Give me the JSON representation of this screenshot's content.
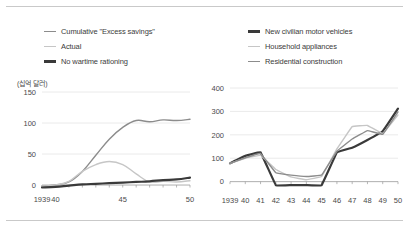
{
  "figure": {
    "background": "#ffffff",
    "rule_color": "#c9c9c9",
    "text_color": "#3b3b3b",
    "grid_color": "#e4e4e4",
    "axis_color": "#9a9a9a"
  },
  "colors": {
    "dark": "#3a3a3a",
    "medium": "#8c8c8c",
    "light": "#c6c6c6"
  },
  "left_panel": {
    "legend": [
      {
        "label": "Cumulative \"Excess savings\"",
        "color": "#8c8c8c",
        "width": 1.4,
        "name": "legend-cumulative-excess-savings"
      },
      {
        "label": "Actual",
        "color": "#c6c6c6",
        "width": 1.4,
        "name": "legend-actual"
      },
      {
        "label": "No wartime rationing",
        "color": "#3a3a3a",
        "width": 2.2,
        "name": "legend-no-wartime-rationing"
      }
    ],
    "unit_label": "(십억 달러)"
  },
  "right_panel": {
    "legend": [
      {
        "label": "New civilian motor vehicles",
        "color": "#3a3a3a",
        "width": 2.2,
        "name": "legend-new-civilian-motor-vehicles"
      },
      {
        "label": "Household appliances",
        "color": "#c6c6c6",
        "width": 1.4,
        "name": "legend-household-appliances"
      },
      {
        "label": "Residential construction",
        "color": "#8c8c8c",
        "width": 1.4,
        "name": "legend-residential-construction"
      }
    ]
  },
  "chart_data": [
    {
      "type": "line",
      "id": "left-chart",
      "title": "",
      "xlabel": "",
      "ylabel": "(십억 달러)",
      "x": [
        1939,
        1940,
        1941,
        1942,
        1943,
        1944,
        1945,
        1946,
        1947,
        1948,
        1949,
        1950
      ],
      "xtick_labels": [
        "1939",
        "40",
        "",
        "",
        "",
        "",
        "45",
        "",
        "",
        "",
        "",
        "50"
      ],
      "xtick_shown": [
        "1939",
        "40",
        "45",
        "50"
      ],
      "ytick_labels": [
        "0",
        "50",
        "100",
        "150"
      ],
      "ylim": [
        -8,
        150
      ],
      "xlim": [
        1939,
        1950
      ],
      "grid": "horizontal",
      "legend_position": "top",
      "series": [
        {
          "name": "Cumulative \"Excess savings\"",
          "color": "#8c8c8c",
          "width": 1.4,
          "values": [
            -2,
            0,
            5,
            22,
            48,
            74,
            93,
            104,
            102,
            105,
            104,
            106
          ]
        },
        {
          "name": "Actual",
          "color": "#c6c6c6",
          "width": 1.4,
          "values": [
            -2,
            0,
            6,
            22,
            33,
            38,
            33,
            18,
            5,
            6,
            5,
            7
          ]
        },
        {
          "name": "No wartime rationing",
          "color": "#3a3a3a",
          "width": 2.2,
          "values": [
            -4,
            -3,
            -1,
            1,
            2,
            3,
            4,
            5,
            6,
            8,
            9,
            12
          ]
        }
      ]
    },
    {
      "type": "line",
      "id": "right-chart",
      "title": "",
      "xlabel": "",
      "ylabel": "",
      "x": [
        1939,
        1940,
        1941,
        1942,
        1943,
        1944,
        1945,
        1946,
        1947,
        1948,
        1949,
        1950
      ],
      "xtick_labels": [
        "1939",
        "40",
        "41",
        "42",
        "43",
        "44",
        "45",
        "46",
        "47",
        "48",
        "49",
        "50"
      ],
      "ytick_labels": [
        "0",
        "100",
        "200",
        "300",
        "400"
      ],
      "ylim": [
        -40,
        400
      ],
      "xlim": [
        1939,
        1950
      ],
      "grid": "horizontal",
      "legend_position": "top",
      "series": [
        {
          "name": "New civilian motor vehicles",
          "color": "#3a3a3a",
          "width": 2.2,
          "values": [
            78,
            110,
            125,
            -15,
            -15,
            -15,
            -15,
            125,
            145,
            178,
            215,
            312
          ]
        },
        {
          "name": "Household appliances",
          "color": "#c6c6c6",
          "width": 1.4,
          "values": [
            78,
            100,
            112,
            52,
            20,
            8,
            22,
            140,
            235,
            240,
            205,
            285
          ]
        },
        {
          "name": "Residential construction",
          "color": "#8c8c8c",
          "width": 1.4,
          "values": [
            78,
            102,
            120,
            38,
            28,
            22,
            28,
            130,
            182,
            218,
            202,
            298
          ]
        }
      ]
    }
  ]
}
